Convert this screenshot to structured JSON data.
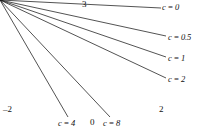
{
  "figure": {
    "title": "",
    "frame": {
      "x0": 20,
      "y0": 17,
      "x1": 155,
      "y1": 112,
      "corner_radius": 7
    },
    "stroke_color": "#1a1a1a"
  },
  "axis_labels": {
    "y_top": "3",
    "x_left": "–2",
    "x_right": "2",
    "x_origin": "0"
  },
  "curve_labels": [
    {
      "id": "c0",
      "text": "c = 0",
      "x": 162,
      "y": 3
    },
    {
      "id": "c05",
      "text": "c = 0.5",
      "x": 168,
      "y": 33
    },
    {
      "id": "c1",
      "text": "c = 1",
      "x": 168,
      "y": 54
    },
    {
      "id": "c2",
      "text": "c = 2",
      "x": 168,
      "y": 75
    },
    {
      "id": "c4",
      "text": "c = 4",
      "x": 58,
      "y": 119
    },
    {
      "id": "c8",
      "text": "c = 8",
      "x": 103,
      "y": 119
    }
  ],
  "chart_data": {
    "type": "line",
    "title": "",
    "xlabel": "",
    "ylabel": "",
    "xlim": [
      -2,
      2
    ],
    "ylim": [
      0,
      3
    ],
    "grid": false,
    "legend_position": "inline-annotations",
    "xticks": [
      -2,
      0,
      2
    ],
    "xtick_labels": [
      "–2",
      "0",
      "2"
    ],
    "yticks": [
      1.5,
      3
    ],
    "ytick_labels": [
      "",
      "3"
    ],
    "x": [
      -2.0,
      -1.9,
      -1.8,
      -1.7,
      -1.6,
      -1.5,
      -1.4,
      -1.3,
      -1.2,
      -1.1,
      -1.0,
      -0.9,
      -0.8,
      -0.7,
      -0.6,
      -0.5,
      -0.4,
      -0.3,
      -0.2,
      -0.1,
      0.0,
      0.1,
      0.2,
      0.3,
      0.4,
      0.5,
      0.6,
      0.7,
      0.8,
      0.9,
      1.0,
      1.1,
      1.2,
      1.3,
      1.4,
      1.5,
      1.6,
      1.7,
      1.8,
      1.9,
      2.0
    ],
    "series": [
      {
        "name": "c = 0",
        "style": "solid",
        "color": "#1a1a1a",
        "values": [
          0.0,
          0.02,
          0.05,
          0.1,
          0.18,
          0.3,
          0.48,
          0.74,
          1.1,
          1.62,
          2.35,
          3.0,
          3.0,
          3.0,
          3.0,
          3.0,
          2.4,
          1.55,
          0.85,
          0.38,
          0.12,
          0.38,
          0.85,
          1.55,
          2.4,
          3.0,
          3.0,
          3.0,
          3.0,
          3.0,
          2.35,
          1.62,
          1.1,
          0.74,
          0.48,
          0.3,
          0.18,
          0.1,
          0.05,
          0.02,
          0.0
        ]
      },
      {
        "name": "c = 0.5",
        "style": "solid",
        "color": "#1a1a1a",
        "values": [
          0.0,
          0.02,
          0.05,
          0.09,
          0.16,
          0.27,
          0.43,
          0.66,
          0.98,
          1.45,
          2.1,
          2.85,
          3.0,
          3.0,
          3.0,
          2.55,
          1.7,
          1.0,
          0.48,
          0.2,
          0.1,
          0.2,
          0.48,
          1.0,
          1.7,
          2.55,
          3.0,
          3.0,
          3.0,
          2.85,
          2.1,
          1.45,
          0.98,
          0.66,
          0.43,
          0.27,
          0.16,
          0.09,
          0.05,
          0.02,
          0.0
        ]
      },
      {
        "name": "c = 1",
        "style": "solid",
        "color": "#1a1a1a",
        "values": [
          0.0,
          0.02,
          0.05,
          0.1,
          0.18,
          0.3,
          0.48,
          0.72,
          1.02,
          1.32,
          1.55,
          1.65,
          1.6,
          1.4,
          1.12,
          0.82,
          0.55,
          0.33,
          0.18,
          0.1,
          0.08,
          0.1,
          0.18,
          0.33,
          0.55,
          0.82,
          1.12,
          1.4,
          1.6,
          1.65,
          1.55,
          1.32,
          1.02,
          0.72,
          0.48,
          0.3,
          0.18,
          0.1,
          0.05,
          0.02,
          0.0
        ]
      },
      {
        "name": "c = 2",
        "style": "dashed",
        "color": "#1a1a1a",
        "values": [
          0.0,
          0.02,
          0.05,
          0.09,
          0.16,
          0.26,
          0.4,
          0.58,
          0.77,
          0.93,
          1.03,
          1.05,
          1.0,
          0.9,
          0.76,
          0.6,
          0.44,
          0.29,
          0.17,
          0.09,
          0.06,
          0.09,
          0.17,
          0.29,
          0.44,
          0.6,
          0.76,
          0.9,
          1.0,
          1.05,
          1.03,
          0.93,
          0.77,
          0.58,
          0.4,
          0.26,
          0.16,
          0.09,
          0.05,
          0.02,
          0.0
        ]
      },
      {
        "name": "c = 4",
        "style": "dashed",
        "color": "#1a1a1a",
        "values": [
          0.0,
          0.02,
          0.05,
          0.09,
          0.15,
          0.23,
          0.33,
          0.45,
          0.56,
          0.65,
          0.71,
          0.72,
          0.69,
          0.63,
          0.54,
          0.44,
          0.33,
          0.23,
          0.14,
          0.08,
          0.05,
          0.08,
          0.14,
          0.23,
          0.33,
          0.44,
          0.54,
          0.63,
          0.69,
          0.72,
          0.71,
          0.65,
          0.56,
          0.45,
          0.33,
          0.23,
          0.15,
          0.09,
          0.05,
          0.02,
          0.0
        ]
      },
      {
        "name": "c = 8",
        "style": "dashed",
        "color": "#1a1a1a",
        "values": [
          0.0,
          0.02,
          0.04,
          0.08,
          0.12,
          0.17,
          0.24,
          0.31,
          0.38,
          0.44,
          0.47,
          0.48,
          0.47,
          0.43,
          0.38,
          0.31,
          0.24,
          0.17,
          0.11,
          0.06,
          0.04,
          0.06,
          0.11,
          0.17,
          0.24,
          0.31,
          0.38,
          0.43,
          0.47,
          0.48,
          0.47,
          0.44,
          0.38,
          0.31,
          0.24,
          0.17,
          0.12,
          0.08,
          0.04,
          0.02,
          0.0
        ]
      }
    ],
    "annotations": [
      {
        "label": "c = 0",
        "points_to": [
          1.66,
          2.85
        ]
      },
      {
        "label": "c = 0.5",
        "points_to": [
          1.45,
          1.45
        ]
      },
      {
        "label": "c = 1",
        "points_to": [
          1.62,
          0.75
        ]
      },
      {
        "label": "c = 2",
        "points_to": [
          1.74,
          0.3
        ]
      },
      {
        "label": "c = 4",
        "points_to": [
          -0.72,
          0.3
        ]
      },
      {
        "label": "c = 8",
        "points_to": [
          0.52,
          0.22
        ]
      }
    ]
  }
}
